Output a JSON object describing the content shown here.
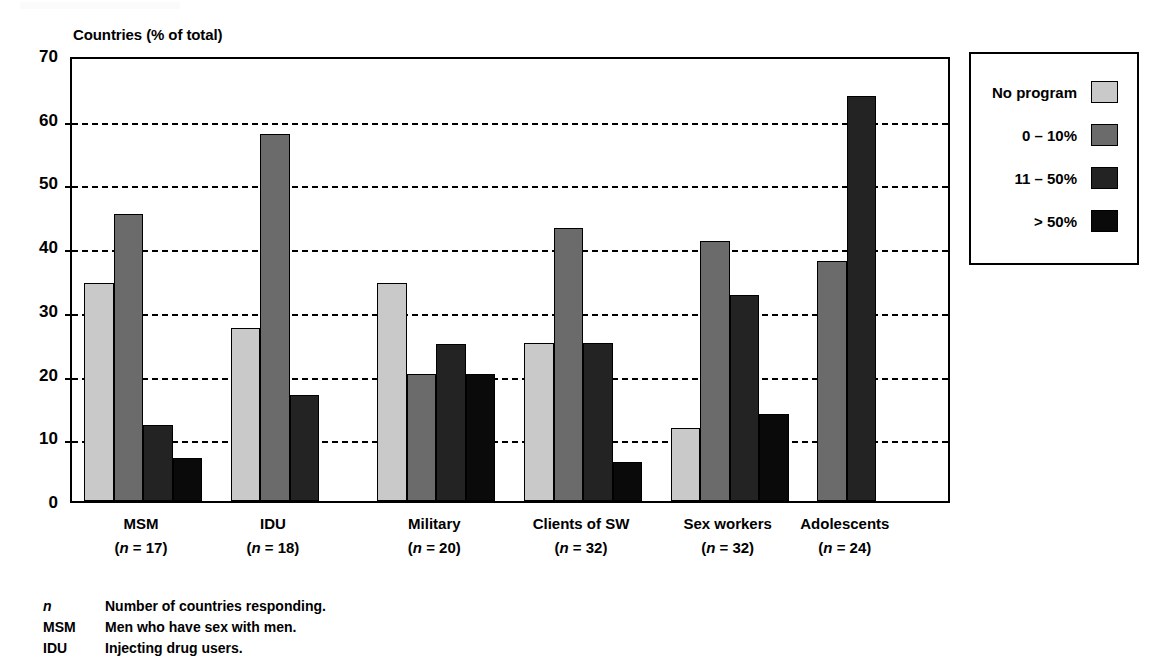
{
  "chart_data": {
    "type": "bar",
    "title": "",
    "ylabel": "Countries (% of total)",
    "xlabel": "",
    "ylim": [
      0,
      70
    ],
    "ytick_step": 10,
    "yticks": [
      70,
      60,
      50,
      40,
      30,
      20,
      10,
      0
    ],
    "grid": true,
    "grid_style": "dashed-horizontal",
    "legend_position": "right-outside",
    "categories": [
      "MSM",
      "IDU",
      "Military",
      "Clients of SW",
      "Sex workers",
      "Adolescents"
    ],
    "category_sublabels": [
      "(n = 17)",
      "(n = 18)",
      "(n = 20)",
      "(n = 32)",
      "(n = 32)",
      "(n = 24)"
    ],
    "category_n": [
      17,
      18,
      20,
      32,
      32,
      24
    ],
    "series": [
      {
        "name": "No program",
        "color": "#c9c9c9",
        "values": [
          34.2,
          27.2,
          34.2,
          24.8,
          11.5,
          null
        ]
      },
      {
        "name": "0 – 10%",
        "color": "#6b6b6b",
        "values": [
          45.1,
          57.6,
          20.0,
          42.8,
          40.8,
          37.7
        ]
      },
      {
        "name": "11 – 50%",
        "color": "#232323",
        "values": [
          12.0,
          16.6,
          24.6,
          24.8,
          32.3,
          63.5
        ]
      },
      {
        "name": "> 50%",
        "color": "#0a0a0a",
        "values": [
          6.7,
          null,
          20.0,
          6.2,
          13.6,
          null
        ]
      }
    ]
  },
  "legend": {
    "items": [
      {
        "label": "No program",
        "color": "#c9c9c9"
      },
      {
        "label": "0 – 10%",
        "color": "#6b6b6b"
      },
      {
        "label": "11 – 50%",
        "color": "#232323"
      },
      {
        "label": "> 50%",
        "color": "#0a0a0a"
      }
    ]
  },
  "footnotes": [
    {
      "key": "n",
      "italic": true,
      "text": "Number of countries responding."
    },
    {
      "key": "MSM",
      "italic": false,
      "text": "Men who have sex with men."
    },
    {
      "key": "IDU",
      "italic": false,
      "text": "Injecting drug users."
    }
  ]
}
